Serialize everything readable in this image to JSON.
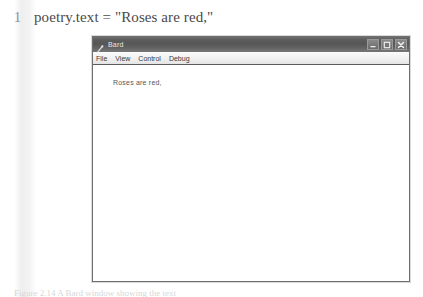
{
  "code_line": {
    "number": "1",
    "text": "poetry.text = \"Roses are red,\""
  },
  "window": {
    "title": "Bard",
    "icon": "bard-app-icon",
    "controls": {
      "minimize": "minimize-icon",
      "maximize": "maximize-icon",
      "close": "close-icon"
    },
    "menu": [
      {
        "label": "File"
      },
      {
        "label": "View"
      },
      {
        "label": "Control"
      },
      {
        "label": "Debug"
      }
    ],
    "content": {
      "text": "Roses are red,"
    }
  },
  "caption": {
    "text": "Figure 2.14  A Bard window showing the text"
  },
  "colors": {
    "titlebar": "#5d5d5d",
    "menubar": "#f0f0f0",
    "window_border": "#6f6f6f",
    "content_bg": "#ffffff",
    "code_text": "#4a4a4a"
  }
}
